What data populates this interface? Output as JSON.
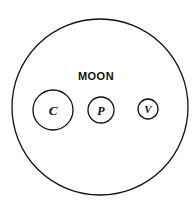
{
  "diagram": {
    "title": "MOON",
    "outer_circle": {
      "cx": 100,
      "cy": 107,
      "r": 88
    },
    "circles": [
      {
        "id": "c",
        "label": "C",
        "cx": 53,
        "cy": 110,
        "r": 20,
        "font_size": 13
      },
      {
        "id": "p",
        "label": "P",
        "cx": 101,
        "cy": 110,
        "r": 13,
        "font_size": 12
      },
      {
        "id": "v",
        "label": "V",
        "cx": 148,
        "cy": 109,
        "r": 10,
        "font_size": 11
      }
    ],
    "stroke_color": "#111111"
  }
}
